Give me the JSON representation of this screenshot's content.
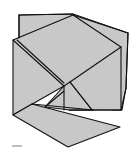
{
  "diagram": {
    "type": "folded-polyhedron-line-drawing",
    "fill_color": "#c8c8c8",
    "stroke_color": "#111111",
    "background": "#ffffff",
    "faces": {
      "back_panel": [
        [
          19,
          15
        ],
        [
          73,
          14
        ],
        [
          128,
          33
        ],
        [
          126,
          88
        ],
        [
          122,
          110
        ],
        [
          112,
          110
        ],
        [
          70,
          80
        ],
        [
          40,
          44
        ],
        [
          19,
          38
        ]
      ],
      "front_square": [
        [
          13,
          40
        ],
        [
          73,
          15
        ],
        [
          121,
          47
        ],
        [
          121,
          110
        ],
        [
          70,
          110
        ],
        [
          64,
          86
        ],
        [
          13,
          115
        ]
      ],
      "bottom_flap": [
        [
          13,
          115
        ],
        [
          32,
          104
        ],
        [
          120,
          127
        ],
        [
          68,
          147
        ]
      ]
    },
    "edges": [
      [
        [
          13,
          40
        ],
        [
          64,
          86
        ]
      ],
      [
        [
          17,
          40
        ],
        [
          64,
          83
        ]
      ],
      [
        [
          64,
          86
        ],
        [
          64,
          110
        ]
      ],
      [
        [
          64,
          86
        ],
        [
          45,
          107
        ]
      ],
      [
        [
          70,
          82
        ],
        [
          121,
          47
        ]
      ],
      [
        [
          70,
          82
        ],
        [
          92,
          110
        ]
      ],
      [
        [
          73,
          15
        ],
        [
          128,
          33
        ]
      ],
      [
        [
          128,
          33
        ],
        [
          126,
          88
        ]
      ],
      [
        [
          126,
          88
        ],
        [
          121,
          110
        ]
      ],
      [
        [
          32,
          104
        ],
        [
          93,
          110
        ]
      ],
      [
        [
          69,
          110
        ],
        [
          121,
          110
        ]
      ]
    ],
    "label_mark": ""
  }
}
